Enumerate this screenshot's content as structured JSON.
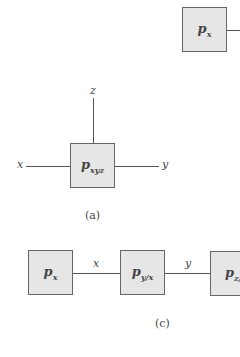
{
  "figure_a": {
    "caption": "(a)",
    "node": {
      "main": "p",
      "sub": "xyz"
    },
    "edges": {
      "top": "z",
      "left": "x",
      "right": "y"
    }
  },
  "figure_b_partial": {
    "node": {
      "main": "p",
      "sub": "x"
    }
  },
  "figure_c": {
    "caption": "(c)",
    "nodes": [
      {
        "main": "p",
        "sub": "x"
      },
      {
        "main": "p",
        "sub": "y/x"
      },
      {
        "main": "p",
        "sub": "z/"
      }
    ],
    "edges": [
      "x",
      "y"
    ]
  }
}
